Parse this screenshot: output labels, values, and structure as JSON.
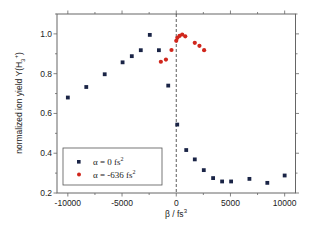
{
  "chart_data": {
    "type": "scatter",
    "title": "",
    "xlabel": "β / fs³",
    "xlabel_base": "β / fs",
    "xlabel_sup": "3",
    "ylabel": "normalized ion yield Y(H₃⁺)",
    "ylabel_base": "normalized ion yield Y(H",
    "ylabel_sub": "3",
    "ylabel_sup": "+",
    "ylabel_end": ")",
    "xlim": [
      -11000,
      11000
    ],
    "ylim": [
      0.2,
      1.1
    ],
    "xticks": [
      -10000,
      -5000,
      0,
      5000,
      10000
    ],
    "xtick_labels": [
      "-10000",
      "-5000",
      "0",
      "5000",
      "10000"
    ],
    "xminor_step": 2500,
    "yticks": [
      0.2,
      0.4,
      0.6,
      0.8,
      1.0
    ],
    "ytick_labels": [
      "0.2",
      "0.4",
      "0.6",
      "0.8",
      "1.0"
    ],
    "yminor_step": 0.1,
    "grid": false,
    "reference_line": {
      "x": 0,
      "style": "dashed"
    },
    "legend_position": "bottom-left",
    "series": [
      {
        "name": "α = 0 fs²",
        "legend_base": "α = 0 fs",
        "legend_sup": "2",
        "marker": "square",
        "color": "#1a2446",
        "x": [
          -10000,
          -8300,
          -6600,
          -4950,
          -4100,
          -3270,
          -2440,
          -1600,
          -740,
          90,
          920,
          1710,
          2540,
          3400,
          4230,
          5060,
          6750,
          8400,
          10000
        ],
        "y": [
          0.68,
          0.733,
          0.797,
          0.857,
          0.888,
          0.918,
          0.995,
          0.918,
          0.74,
          0.544,
          0.416,
          0.369,
          0.315,
          0.275,
          0.258,
          0.258,
          0.271,
          0.251,
          0.288
        ]
      },
      {
        "name": "α = -636 fs²",
        "legend_base": "α = -636 fs",
        "legend_sup": "2",
        "marker": "circle",
        "color": "#d0261c",
        "x": [
          -1420,
          -950,
          -440,
          0,
          100,
          300,
          550,
          830,
          1710,
          2140,
          2570
        ],
        "y": [
          0.86,
          0.871,
          0.919,
          0.965,
          0.98,
          0.99,
          0.997,
          0.988,
          0.955,
          0.94,
          0.918
        ]
      }
    ]
  }
}
